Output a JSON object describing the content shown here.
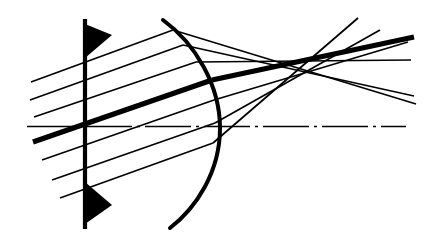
{
  "figure": {
    "width": 429,
    "height": 238,
    "background_color": "#ffffff",
    "ink_color": "#000000"
  },
  "optical_axis": {
    "label": "optical-axis",
    "style": "dash-dot",
    "y": 126.5,
    "x_start": 27,
    "x_end": 406,
    "stroke_width": 1.6,
    "dash_pattern": "46,5,3,5"
  },
  "aperture_stop": {
    "label": "aperture-stop",
    "x": 85,
    "y_top": 19,
    "y_bottom": 229,
    "stroke_width": 4.2,
    "wedges": [
      {
        "name": "stop-wedge-top",
        "points": "85,24 112,35 85,58"
      },
      {
        "name": "stop-wedge-bottom",
        "points": "85,224 112,205 85,182"
      }
    ]
  },
  "refracting_surface": {
    "label": "curved-refracting-surface",
    "stroke_width": 4.0,
    "path": "M 163,20 C 196,44 220,86 220,128 C 220,172 196,208 170,228",
    "vertex_x": 220,
    "vertex_y": 128
  },
  "rays": {
    "count": 7,
    "thin_stroke_width": 1.7,
    "chief_stroke_width": 5.2,
    "items": [
      {
        "name": "ray-1",
        "kind": "marginal-upper",
        "thick": false,
        "incoming": "M 31,82 L 173,30",
        "outgoing": "M 173,30 L 416,104"
      },
      {
        "name": "ray-2",
        "kind": "zonal-upper",
        "thick": false,
        "incoming": "M 30,100 L 183,45",
        "outgoing": "M 183,45 L 414,96"
      },
      {
        "name": "ray-3",
        "kind": "paraxial-upper",
        "thick": false,
        "incoming": "M 34,117 L 196,62",
        "outgoing": "M 196,62 L 411,60"
      },
      {
        "name": "ray-4-chief",
        "kind": "chief-ray",
        "thick": true,
        "incoming": "M 33,142 L 212,80",
        "outgoing": "M 212,80 L 414,37"
      },
      {
        "name": "ray-5",
        "kind": "paraxial-lower",
        "thick": false,
        "incoming": "M 42,160 L 214,100",
        "outgoing": "M 214,100 L 408,42"
      },
      {
        "name": "ray-6",
        "kind": "zonal-lower",
        "thick": false,
        "incoming": "M 52,180 L 215,123",
        "outgoing": "M 215,123 L 380,30"
      },
      {
        "name": "ray-7",
        "kind": "marginal-lower",
        "thick": false,
        "incoming": "M 60,198 L 213,143",
        "outgoing": "M 213,143 L 358,18"
      }
    ]
  },
  "caustic": {
    "label": "coma-caustic-crossing-region",
    "center_x": 347,
    "center_y": 45
  }
}
